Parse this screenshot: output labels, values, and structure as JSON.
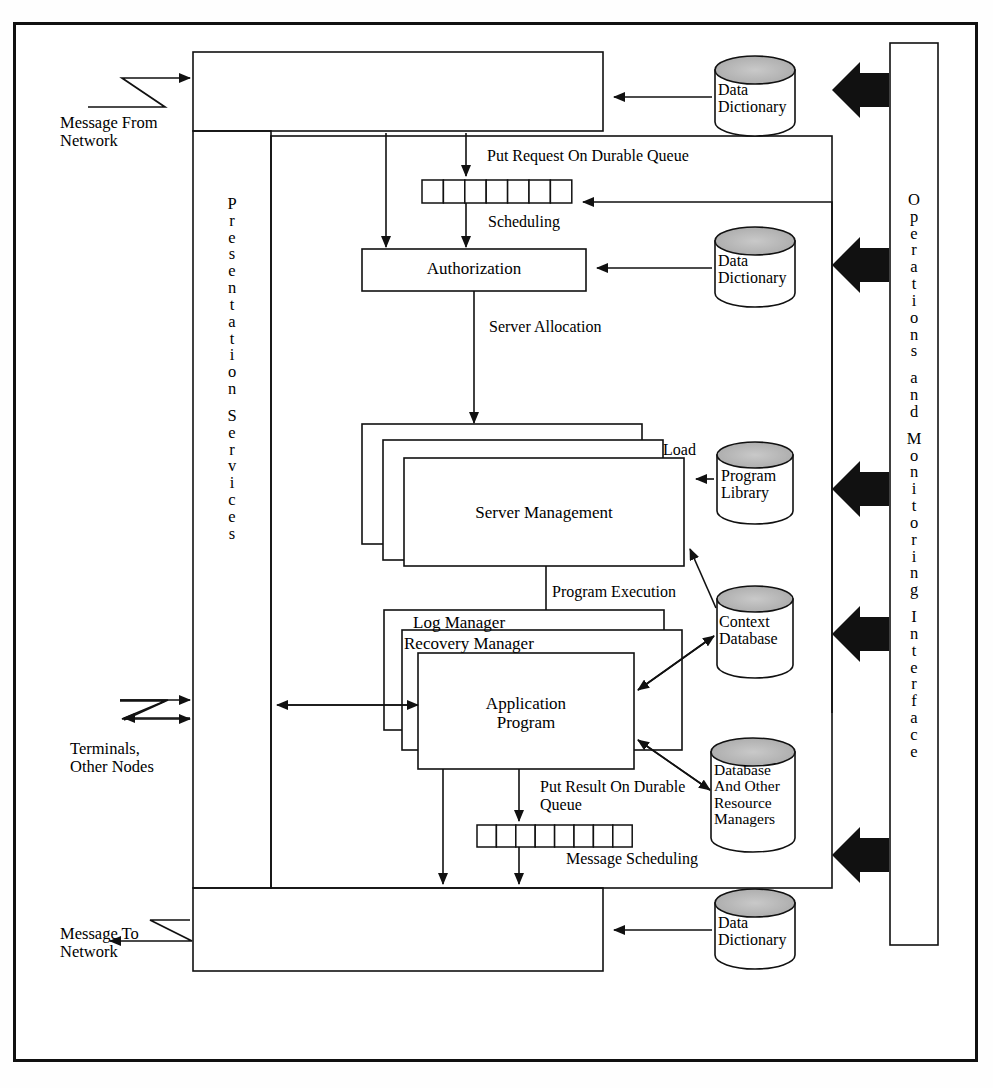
{
  "diagram": {
    "presentation_services_label": "Presentation Services",
    "operations_interface_label": "Operations and Monitoring Interface",
    "external_labels": {
      "message_from_network": "Message From\nNetwork",
      "terminals_other_nodes": "Terminals,\nOther Nodes",
      "message_to_network": "Message To\nNetwork"
    },
    "flow_labels": {
      "put_request_on_durable_queue": "Put Request On Durable Queue",
      "scheduling": "Scheduling",
      "server_allocation": "Server Allocation",
      "load": "Load",
      "program_execution": "Program Execution",
      "put_result_on_durable_queue": "Put Result On Durable\nQueue",
      "message_scheduling": "Message Scheduling"
    },
    "boxes": {
      "authorization": "Authorization",
      "server_management": "Server Management",
      "log_manager": "Log Manager",
      "recovery_manager": "Recovery Manager",
      "application_program": "Application\nProgram"
    },
    "stores": {
      "data_dictionary_top": "Data\nDictionary",
      "data_dictionary_mid": "Data\nDictionary",
      "data_dictionary_bottom": "Data\nDictionary",
      "program_library": "Program\nLibrary",
      "context_database": "Context\nDatabase",
      "database_and_other_resource_managers": "Database\nAnd Other\nResource\nManagers"
    },
    "queues": {
      "request_queue_cells": 7,
      "result_queue_cells": 8
    },
    "colors": {
      "line": "#111111",
      "cylinder_top_fill": "#b8b8b8",
      "cylinder_body_fill": "#ffffff",
      "arrow_block_fill": "#111111",
      "background": "#ffffff"
    }
  }
}
